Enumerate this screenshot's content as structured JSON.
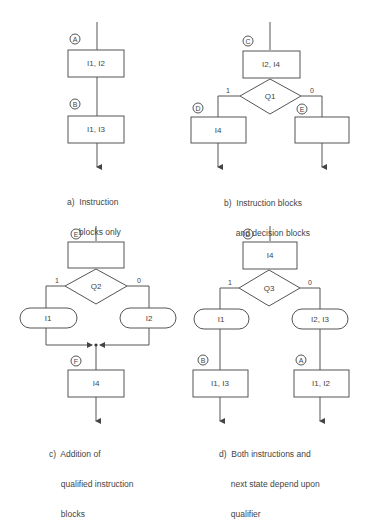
{
  "panels": {
    "a": {
      "caption": [
        "a)  Instruction",
        "     blocks only"
      ],
      "states": [
        "A",
        "B"
      ],
      "blocks": [
        "I1, I2",
        "I1, I3"
      ]
    },
    "b": {
      "caption": [
        "b)  Instruction blocks",
        "     and decision blocks"
      ],
      "states": [
        "C",
        "D",
        "E"
      ],
      "blocks": [
        "I2, I4",
        "I4",
        ""
      ],
      "decision": "Q1",
      "branch_labels": [
        "1",
        "0"
      ]
    },
    "c": {
      "caption": [
        "c)  Addition of",
        "     qualified instruction",
        "     blocks"
      ],
      "states": [
        "E",
        "F"
      ],
      "blocks": [
        "",
        "I4"
      ],
      "decision": "Q2",
      "branch_labels": [
        "1",
        "0"
      ],
      "conditional_outputs": [
        "I1",
        "I2"
      ]
    },
    "d": {
      "caption": [
        "d)  Both instructions and",
        "     next state depend upon",
        "     qualifier"
      ],
      "states": [
        "D",
        "B",
        "A"
      ],
      "blocks": [
        "I4",
        "I1, I3",
        "I1, I2"
      ],
      "decision": "Q3",
      "branch_labels": [
        "1",
        "0"
      ],
      "conditional_outputs": [
        "I1",
        "I2, I3"
      ]
    }
  },
  "colors": {
    "line": "#555555",
    "text": "#444444",
    "background": "#ffffff"
  }
}
